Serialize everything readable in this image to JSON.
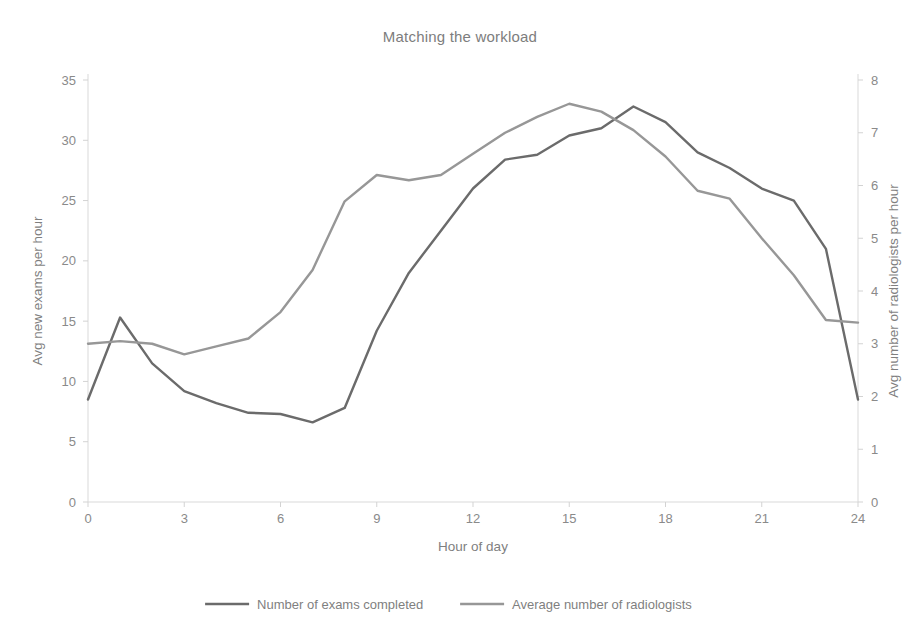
{
  "chart_data": {
    "type": "line",
    "title": "Matching the workload",
    "xlabel": "Hour of day",
    "ylabel": "Avg new exams per hour",
    "y2label": "Avg number of radiologists per hour",
    "x": [
      0,
      1,
      2,
      3,
      4,
      5,
      6,
      7,
      8,
      9,
      10,
      11,
      12,
      13,
      14,
      15,
      16,
      17,
      18,
      19,
      20,
      21,
      22,
      23,
      24
    ],
    "xlim": [
      0,
      24
    ],
    "xticks": [
      0,
      3,
      6,
      9,
      12,
      15,
      18,
      21,
      24
    ],
    "xtick_labels": [
      "0",
      "3",
      "6",
      "9",
      "12",
      "15",
      "18",
      "21",
      "24"
    ],
    "ylim": [
      0,
      35
    ],
    "yticks": [
      0,
      5,
      10,
      15,
      20,
      25,
      30,
      35
    ],
    "ytick_labels": [
      "0",
      "5",
      "10",
      "15",
      "20",
      "25",
      "30",
      "35"
    ],
    "y2lim": [
      0,
      8
    ],
    "y2ticks": [
      0,
      1,
      2,
      3,
      4,
      5,
      6,
      7,
      8
    ],
    "y2tick_labels": [
      "0",
      "1",
      "2",
      "3",
      "4",
      "5",
      "6",
      "7",
      "8"
    ],
    "grid": false,
    "legend_position": "bottom",
    "series": [
      {
        "name": "Number of exams completed",
        "axis": "left",
        "color": "#6b6b6b",
        "values": [
          8.5,
          15.3,
          11.5,
          9.2,
          8.2,
          7.4,
          7.3,
          6.6,
          7.8,
          14.2,
          19.0,
          22.5,
          26.0,
          28.4,
          28.8,
          30.4,
          31.0,
          32.8,
          31.5,
          29.0,
          27.7,
          26.0,
          25.0,
          21.0,
          8.5
        ]
      },
      {
        "name": "Average number of radiologists",
        "axis": "right",
        "color": "#979797",
        "values": [
          3.0,
          3.05,
          3.0,
          2.8,
          2.95,
          3.1,
          3.6,
          4.4,
          5.7,
          6.2,
          6.1,
          6.2,
          6.6,
          7.0,
          7.3,
          7.55,
          7.4,
          7.05,
          6.55,
          5.9,
          5.75,
          5.0,
          4.3,
          3.45,
          3.4
        ]
      }
    ]
  }
}
